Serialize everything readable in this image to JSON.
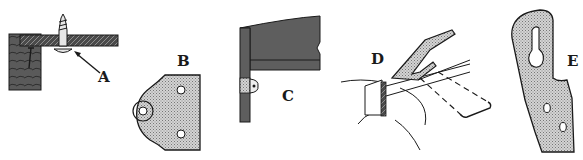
{
  "figure": {
    "panels": [
      {
        "label": "A",
        "subject": "screw through panel with washer"
      },
      {
        "label": "B",
        "subject": "rounded mounting plate with holes"
      },
      {
        "label": "C",
        "subject": "corner bracket on frame"
      },
      {
        "label": "D",
        "subject": "spring clip on frame"
      },
      {
        "label": "E",
        "subject": "keyhole hanger plate"
      }
    ]
  },
  "colors": {
    "ink": "#1a1a1a",
    "dark_fill": "#555555",
    "stipple_fill": "#c8c8c8",
    "background": "#ffffff"
  }
}
